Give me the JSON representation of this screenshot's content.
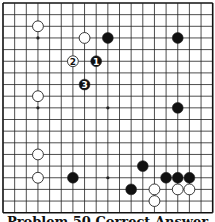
{
  "diagram": {
    "type": "go-board",
    "size": 19,
    "origin": {
      "x": 3,
      "y": 3
    },
    "spacing": 11.65,
    "colors": {
      "line": "#222222",
      "border": "#111111",
      "black_stone": "#111111",
      "white_stone": "#ffffff",
      "white_stroke": "#222222"
    },
    "star_points": [
      [
        3,
        3
      ],
      [
        9,
        3
      ],
      [
        15,
        3
      ],
      [
        3,
        9
      ],
      [
        9,
        9
      ],
      [
        15,
        9
      ],
      [
        3,
        15
      ],
      [
        9,
        15
      ],
      [
        15,
        15
      ]
    ],
    "stones": [
      {
        "color": "white",
        "col": 3,
        "row": 2,
        "label": ""
      },
      {
        "color": "white",
        "col": 7,
        "row": 3,
        "label": ""
      },
      {
        "color": "black",
        "col": 9,
        "row": 3,
        "label": ""
      },
      {
        "color": "black",
        "col": 15,
        "row": 3,
        "label": ""
      },
      {
        "color": "white",
        "col": 6,
        "row": 5,
        "label": "2"
      },
      {
        "color": "black",
        "col": 8,
        "row": 5,
        "label": "1"
      },
      {
        "color": "black",
        "col": 7,
        "row": 7,
        "label": "3"
      },
      {
        "color": "white",
        "col": 3,
        "row": 8,
        "label": ""
      },
      {
        "color": "black",
        "col": 15,
        "row": 9,
        "label": ""
      },
      {
        "color": "white",
        "col": 3,
        "row": 13,
        "label": ""
      },
      {
        "color": "black",
        "col": 12,
        "row": 14,
        "label": ""
      },
      {
        "color": "white",
        "col": 3,
        "row": 15,
        "label": ""
      },
      {
        "color": "black",
        "col": 6,
        "row": 15,
        "label": ""
      },
      {
        "color": "black",
        "col": 14,
        "row": 15,
        "label": ""
      },
      {
        "color": "black",
        "col": 15,
        "row": 15,
        "label": ""
      },
      {
        "color": "black",
        "col": 16,
        "row": 15,
        "label": ""
      },
      {
        "color": "black",
        "col": 11,
        "row": 16,
        "label": ""
      },
      {
        "color": "white",
        "col": 13,
        "row": 16,
        "label": ""
      },
      {
        "color": "white",
        "col": 15,
        "row": 16,
        "label": ""
      },
      {
        "color": "white",
        "col": 16,
        "row": 16,
        "label": ""
      },
      {
        "color": "white",
        "col": 13,
        "row": 17,
        "label": ""
      }
    ]
  },
  "caption": "Problem 50 Correct Answer"
}
